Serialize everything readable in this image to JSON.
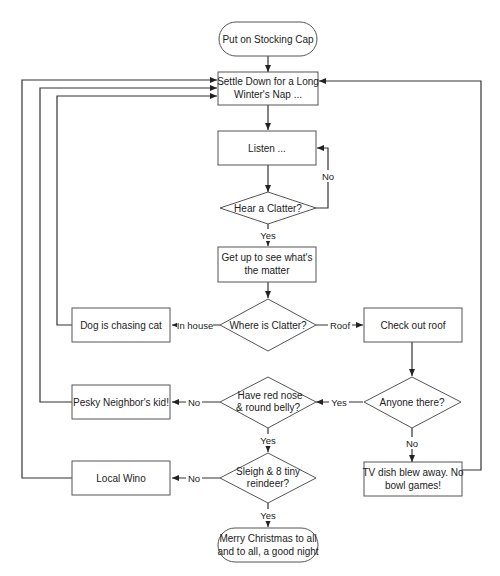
{
  "diagram": {
    "type": "flowchart",
    "nodes": {
      "start": {
        "label_lines": [
          "Put on Stocking Cap"
        ],
        "shape": "terminator"
      },
      "nap": {
        "label_lines": [
          "Settle Down for a Long",
          "Winter's Nap ..."
        ],
        "shape": "process"
      },
      "listen": {
        "label_lines": [
          "Listen ..."
        ],
        "shape": "process"
      },
      "hear": {
        "label_lines": [
          "Hear a Clatter?"
        ],
        "shape": "decision"
      },
      "getup": {
        "label_lines": [
          "Get up to see what's",
          "the matter"
        ],
        "shape": "process"
      },
      "where": {
        "label_lines": [
          "Where is Clatter?"
        ],
        "shape": "decision"
      },
      "dog": {
        "label_lines": [
          "Dog is chasing cat"
        ],
        "shape": "process"
      },
      "roof": {
        "label_lines": [
          "Check out roof"
        ],
        "shape": "process"
      },
      "anyone": {
        "label_lines": [
          "Anyone there?"
        ],
        "shape": "decision"
      },
      "rednose": {
        "label_lines": [
          "Have red nose",
          "& round belly?"
        ],
        "shape": "decision"
      },
      "neighbor": {
        "label_lines": [
          "Pesky Neighbor's kid!"
        ],
        "shape": "process"
      },
      "tvdish": {
        "label_lines": [
          "TV dish blew away. No",
          "bowl games!"
        ],
        "shape": "process"
      },
      "sleigh": {
        "label_lines": [
          "Sleigh & 8 tiny",
          "reindeer?"
        ],
        "shape": "decision"
      },
      "wino": {
        "label_lines": [
          "Local Wino"
        ],
        "shape": "process"
      },
      "end": {
        "label_lines": [
          "Merry Christmas to all",
          "and to all, a good night"
        ],
        "shape": "terminator"
      }
    },
    "edge_labels": {
      "hear_no": "No",
      "hear_yes": "Yes",
      "where_inhouse": "In house",
      "where_roof": "Roof",
      "anyone_yes": "Yes",
      "anyone_no": "No",
      "rednose_no": "No",
      "rednose_yes": "Yes",
      "sleigh_no": "No",
      "sleigh_yes": "Yes"
    },
    "edges": [
      {
        "from": "start",
        "to": "nap"
      },
      {
        "from": "nap",
        "to": "listen"
      },
      {
        "from": "listen",
        "to": "hear"
      },
      {
        "from": "hear",
        "to": "listen",
        "label": "No"
      },
      {
        "from": "hear",
        "to": "getup",
        "label": "Yes"
      },
      {
        "from": "getup",
        "to": "where"
      },
      {
        "from": "where",
        "to": "dog",
        "label": "In house"
      },
      {
        "from": "where",
        "to": "roof",
        "label": "Roof"
      },
      {
        "from": "dog",
        "to": "nap"
      },
      {
        "from": "roof",
        "to": "anyone"
      },
      {
        "from": "anyone",
        "to": "rednose",
        "label": "Yes"
      },
      {
        "from": "anyone",
        "to": "tvdish",
        "label": "No"
      },
      {
        "from": "rednose",
        "to": "neighbor",
        "label": "No"
      },
      {
        "from": "rednose",
        "to": "sleigh",
        "label": "Yes"
      },
      {
        "from": "neighbor",
        "to": "nap"
      },
      {
        "from": "tvdish",
        "to": "nap"
      },
      {
        "from": "sleigh",
        "to": "wino",
        "label": "No"
      },
      {
        "from": "sleigh",
        "to": "end",
        "label": "Yes"
      },
      {
        "from": "wino",
        "to": "nap"
      }
    ],
    "colors": {
      "stroke": "#333333",
      "fill": "#ffffff",
      "text": "#222222"
    }
  }
}
